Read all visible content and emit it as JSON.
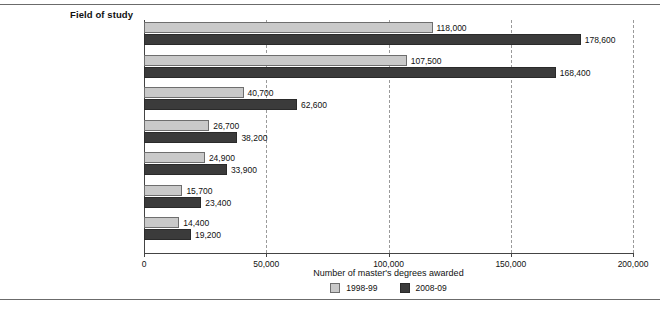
{
  "chart_data": {
    "type": "bar",
    "orientation": "horizontal",
    "title": "Field of study",
    "xlabel": "Number of master's degrees awarded",
    "ylabel": "Field of study",
    "xlim": [
      0,
      200000
    ],
    "xticks": [
      0,
      50000,
      100000,
      150000,
      200000
    ],
    "xtick_labels": [
      "0",
      "50,000",
      "100,000",
      "150,000",
      "200,000"
    ],
    "grid": "vertical-dashed",
    "legend_position": "bottom-center",
    "categories": [
      "Education",
      "Business",
      "Health professions and\nrelated clinical sciences",
      "Engineering and\nengineering technologies",
      "Public administration\nand social service professors",
      "Psychology",
      "Social sciences\nand history"
    ],
    "category_lines": [
      [
        "Education"
      ],
      [
        "Business"
      ],
      [
        "Health professions and",
        "related clinical sciences"
      ],
      [
        "Engineering and",
        "engineering technologies"
      ],
      [
        "Public administration",
        "and social service professors"
      ],
      [
        "Psychology"
      ],
      [
        "Social sciences",
        "and history"
      ]
    ],
    "series": [
      {
        "name": "1998-99",
        "color": "#c9c9c9",
        "values": [
          118000,
          107500,
          40700,
          26700,
          24900,
          15700,
          14400
        ],
        "value_labels": [
          "118,000",
          "107,500",
          "40,700",
          "26,700",
          "24,900",
          "15,700",
          "14,400"
        ]
      },
      {
        "name": "2008-09",
        "color": "#3b3b3b",
        "values": [
          178600,
          168400,
          62600,
          38200,
          33900,
          23400,
          19200
        ],
        "value_labels": [
          "178,600",
          "168,400",
          "62,600",
          "38,200",
          "33,900",
          "23,400",
          "19,200"
        ]
      }
    ],
    "legend": [
      {
        "label": "1998-99",
        "color": "#c9c9c9",
        "swatch": "s1"
      },
      {
        "label": "2008-09",
        "color": "#3b3b3b",
        "swatch": "s2"
      }
    ]
  }
}
